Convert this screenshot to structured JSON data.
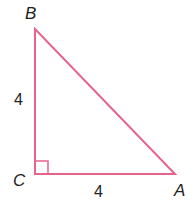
{
  "diagram": {
    "type": "right-triangle",
    "stroke_color": "#e8638a",
    "vertices": {
      "B": {
        "label": "B",
        "x": 35,
        "y": 29
      },
      "C": {
        "label": "C",
        "x": 35,
        "y": 174
      },
      "A": {
        "label": "A",
        "x": 175,
        "y": 174
      }
    },
    "sides": {
      "BC": {
        "label": "4"
      },
      "CA": {
        "label": "4"
      }
    },
    "right_angle_at": "C"
  }
}
